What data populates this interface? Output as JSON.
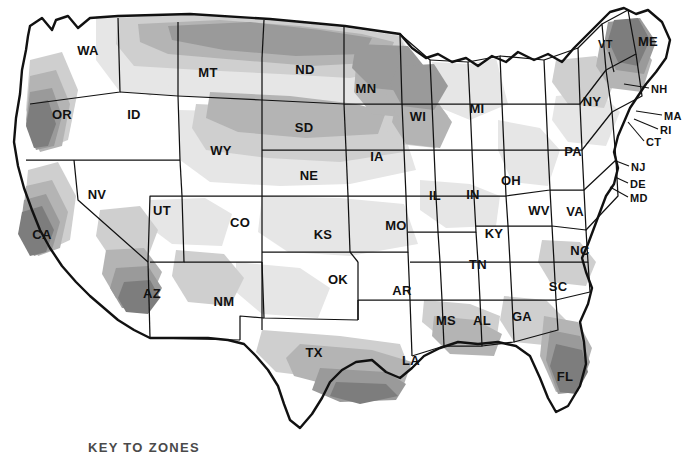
{
  "caption": {
    "key_to_zones": "KEY TO ZONES"
  },
  "map": {
    "title": "United States climate zone map",
    "zone_colors": {
      "zone_lightest": "#ffffff",
      "zone_light": "#e6e6e6",
      "zone_mid_light": "#cfcfcf",
      "zone_mid": "#b4b4b4",
      "zone_dark": "#9a9a9a",
      "zone_darkest": "#7d7d7d",
      "border": "#111111",
      "label": "#111111",
      "caption": "#4a4a4a"
    },
    "states": [
      {
        "abbr": "WA",
        "x": 88,
        "y": 52,
        "placement": "inside"
      },
      {
        "abbr": "OR",
        "x": 62,
        "y": 116,
        "placement": "inside"
      },
      {
        "abbr": "CA",
        "x": 42,
        "y": 236,
        "placement": "inside"
      },
      {
        "abbr": "NV",
        "x": 97,
        "y": 196,
        "placement": "inside"
      },
      {
        "abbr": "ID",
        "x": 134,
        "y": 116,
        "placement": "inside"
      },
      {
        "abbr": "MT",
        "x": 208,
        "y": 74,
        "placement": "inside"
      },
      {
        "abbr": "WY",
        "x": 221,
        "y": 152,
        "placement": "inside"
      },
      {
        "abbr": "UT",
        "x": 162,
        "y": 212,
        "placement": "inside"
      },
      {
        "abbr": "AZ",
        "x": 152,
        "y": 295,
        "placement": "inside"
      },
      {
        "abbr": "CO",
        "x": 240,
        "y": 224,
        "placement": "inside"
      },
      {
        "abbr": "NM",
        "x": 224,
        "y": 303,
        "placement": "inside"
      },
      {
        "abbr": "ND",
        "x": 305,
        "y": 71,
        "placement": "inside"
      },
      {
        "abbr": "SD",
        "x": 304,
        "y": 129,
        "placement": "inside"
      },
      {
        "abbr": "NE",
        "x": 309,
        "y": 177,
        "placement": "inside"
      },
      {
        "abbr": "KS",
        "x": 323,
        "y": 236,
        "placement": "inside"
      },
      {
        "abbr": "OK",
        "x": 338,
        "y": 281,
        "placement": "inside"
      },
      {
        "abbr": "TX",
        "x": 314,
        "y": 354,
        "placement": "inside"
      },
      {
        "abbr": "MN",
        "x": 366,
        "y": 90,
        "placement": "inside"
      },
      {
        "abbr": "IA",
        "x": 377,
        "y": 158,
        "placement": "inside"
      },
      {
        "abbr": "MO",
        "x": 396,
        "y": 227,
        "placement": "inside"
      },
      {
        "abbr": "AR",
        "x": 402,
        "y": 292,
        "placement": "inside"
      },
      {
        "abbr": "LA",
        "x": 411,
        "y": 362,
        "placement": "inside"
      },
      {
        "abbr": "WI",
        "x": 418,
        "y": 118,
        "placement": "inside"
      },
      {
        "abbr": "IL",
        "x": 435,
        "y": 197,
        "placement": "inside"
      },
      {
        "abbr": "MS",
        "x": 446,
        "y": 322,
        "placement": "inside"
      },
      {
        "abbr": "MI",
        "x": 477,
        "y": 110,
        "placement": "inside"
      },
      {
        "abbr": "IN",
        "x": 473,
        "y": 196,
        "placement": "inside"
      },
      {
        "abbr": "KY",
        "x": 494,
        "y": 235,
        "placement": "inside"
      },
      {
        "abbr": "TN",
        "x": 478,
        "y": 266,
        "placement": "inside"
      },
      {
        "abbr": "AL",
        "x": 482,
        "y": 322,
        "placement": "inside"
      },
      {
        "abbr": "OH",
        "x": 511,
        "y": 182,
        "placement": "inside"
      },
      {
        "abbr": "WV",
        "x": 539,
        "y": 212,
        "placement": "inside"
      },
      {
        "abbr": "GA",
        "x": 522,
        "y": 318,
        "placement": "inside"
      },
      {
        "abbr": "FL",
        "x": 565,
        "y": 378,
        "placement": "inside"
      },
      {
        "abbr": "SC",
        "x": 558,
        "y": 288,
        "placement": "inside"
      },
      {
        "abbr": "NC",
        "x": 580,
        "y": 252,
        "placement": "inside"
      },
      {
        "abbr": "VA",
        "x": 575,
        "y": 213,
        "placement": "inside"
      },
      {
        "abbr": "PA",
        "x": 573,
        "y": 153,
        "placement": "inside"
      },
      {
        "abbr": "NY",
        "x": 592,
        "y": 103,
        "placement": "inside"
      },
      {
        "abbr": "ME",
        "x": 648,
        "y": 43,
        "placement": "inside"
      }
    ],
    "callout_states": [
      {
        "abbr": "VT",
        "label_x": 598,
        "label_y": 45,
        "line": "M 609,52 L 614,72"
      },
      {
        "abbr": "NH",
        "label_x": 651,
        "label_y": 90,
        "line": "M 649,88 L 624,84"
      },
      {
        "abbr": "MA",
        "label_x": 664,
        "label_y": 117,
        "line": "M 662,115 L 636,111"
      },
      {
        "abbr": "RI",
        "label_x": 660,
        "label_y": 131,
        "line": "M 658,129 L 634,119"
      },
      {
        "abbr": "CT",
        "label_x": 646,
        "label_y": 143,
        "line": "M 644,141 L 628,122"
      },
      {
        "abbr": "NJ",
        "label_x": 631,
        "label_y": 168,
        "line": "M 629,166 L 616,161"
      },
      {
        "abbr": "DE",
        "label_x": 630,
        "label_y": 185,
        "line": "M 628,183 L 615,177"
      },
      {
        "abbr": "MD",
        "label_x": 630,
        "label_y": 199,
        "line": "M 628,197 L 610,187"
      }
    ]
  }
}
